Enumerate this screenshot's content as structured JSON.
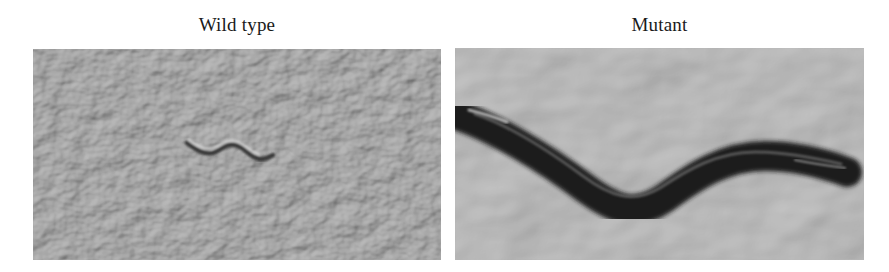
{
  "figure": {
    "panels": [
      {
        "label": "Wild type",
        "description": "Small thin nematode on agar plate with dense meandering track texture",
        "colors": {
          "background": "#a9a9a9",
          "worm": "#3a3a3a"
        }
      },
      {
        "label": "Mutant",
        "description": "Large dark elongated nematode on textured agar plate",
        "colors": {
          "background": "#b5b5b5",
          "worm": "#1c1c1c"
        }
      }
    ]
  }
}
